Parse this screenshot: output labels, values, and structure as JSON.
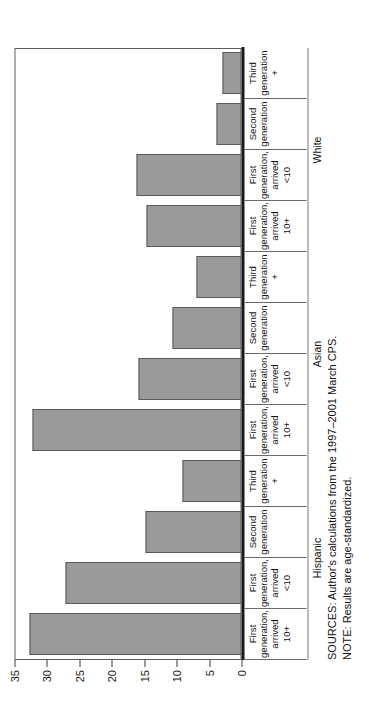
{
  "chart_data": {
    "type": "bar",
    "orientation": "vertical-rotated",
    "title": "",
    "xlabel": "",
    "ylabel": "Percentage",
    "ylim": [
      0,
      35
    ],
    "yticks": [
      0,
      5,
      10,
      15,
      20,
      25,
      30,
      35
    ],
    "grid": false,
    "legend": "none",
    "bar_color": "#9a9a9a",
    "categories": [
      "First generation, arrived 10+",
      "First generation, arrived <10",
      "Second generation",
      "Third generation +",
      "First generation, arrived 10+",
      "First generation, arrived <10",
      "Second generation",
      "Third generation +",
      "First generation, arrived 10+",
      "First generation, arrived <10",
      "Second generation",
      "Third generation +"
    ],
    "category_lines": [
      [
        "First",
        "generation,",
        "arrived",
        "10+"
      ],
      [
        "First",
        "generation,",
        "arrived",
        "<10"
      ],
      [
        "Second",
        "generation",
        "",
        ""
      ],
      [
        "Third",
        "generation",
        "+",
        ""
      ],
      [
        "First",
        "generation,",
        "arrived",
        "10+"
      ],
      [
        "First",
        "generation,",
        "arrived",
        "<10"
      ],
      [
        "Second",
        "generation",
        "",
        ""
      ],
      [
        "Third",
        "generation",
        "+",
        ""
      ],
      [
        "First",
        "generation,",
        "arrived",
        "10+"
      ],
      [
        "First",
        "generation,",
        "arrived",
        "<10"
      ],
      [
        "Second",
        "generation",
        "",
        ""
      ],
      [
        "Third",
        "generation",
        "+",
        ""
      ]
    ],
    "groups": [
      {
        "label": "Hispanic",
        "start": 0,
        "count": 4
      },
      {
        "label": "Asian",
        "start": 4,
        "count": 4
      },
      {
        "label": "White",
        "start": 8,
        "count": 4
      }
    ],
    "values": [
      32.7,
      27.2,
      14.8,
      9.1,
      32.2,
      15.9,
      10.7,
      6.9,
      14.6,
      16.2,
      3.8,
      2.9
    ]
  },
  "notes": {
    "sources": "SOURCES: Author's calculations from the 1997–2001 March CPS.",
    "note": "NOTE: Results are age-standardized."
  }
}
